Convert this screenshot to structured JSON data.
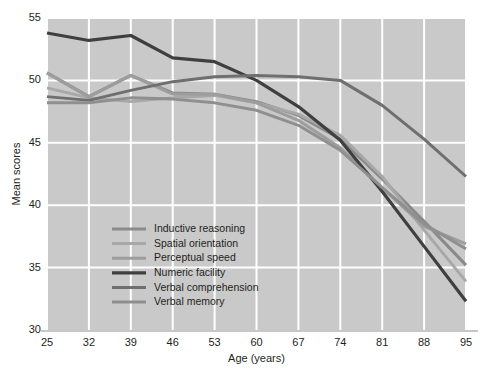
{
  "chart_data": {
    "type": "line",
    "title": "",
    "xlabel": "Age (years)",
    "ylabel": "Mean scores",
    "x": [
      25,
      32,
      39,
      46,
      53,
      60,
      67,
      74,
      81,
      88,
      95
    ],
    "categories": [
      "25",
      "32",
      "39",
      "46",
      "53",
      "60",
      "67",
      "74",
      "81",
      "88",
      "95"
    ],
    "xlim": [
      25,
      95
    ],
    "ylim": [
      30,
      55
    ],
    "xticks": [
      25,
      32,
      39,
      46,
      53,
      60,
      67,
      74,
      81,
      88,
      95
    ],
    "yticks": [
      30,
      35,
      40,
      45,
      50,
      55
    ],
    "grid": true,
    "grid_color": "#ffffff",
    "plot_background": "#c9c9c9",
    "figure_background": "#ffffff",
    "legend_position": "inside lower-left",
    "series": [
      {
        "name": "Inductive reasoning",
        "color": "#8a8a8a",
        "width": 3.0,
        "values": [
          50.6,
          48.7,
          50.4,
          49.0,
          48.9,
          48.3,
          47.2,
          45.3,
          42.1,
          38.7,
          35.2
        ]
      },
      {
        "name": "Spatial orientation",
        "color": "#a8a8a8",
        "width": 3.0,
        "values": [
          49.4,
          48.6,
          48.3,
          48.6,
          48.8,
          48.2,
          47.3,
          45.6,
          42.3,
          38.0,
          33.9
        ]
      },
      {
        "name": "Perceptual speed",
        "color": "#9d9d9d",
        "width": 3.0,
        "values": [
          50.6,
          48.7,
          50.4,
          48.9,
          48.9,
          48.2,
          46.8,
          44.6,
          41.4,
          38.3,
          36.9
        ]
      },
      {
        "name": "Numeric facility",
        "color": "#3f3f3f",
        "width": 3.2,
        "values": [
          53.8,
          53.2,
          53.6,
          51.8,
          51.5,
          50.0,
          47.9,
          45.2,
          41.1,
          36.7,
          32.3
        ]
      },
      {
        "name": "Verbal comprehension",
        "color": "#6f6f6f",
        "width": 3.0,
        "values": [
          48.7,
          48.4,
          49.2,
          49.9,
          50.3,
          50.4,
          50.3,
          50.0,
          48.0,
          45.3,
          42.3
        ]
      },
      {
        "name": "Verbal memory",
        "color": "#8f8f8f",
        "width": 3.0,
        "values": [
          48.2,
          48.2,
          48.6,
          48.5,
          48.2,
          47.6,
          46.4,
          44.4,
          41.4,
          38.5,
          36.5
        ]
      }
    ]
  },
  "legend": {
    "items": [
      {
        "label": "Inductive reasoning"
      },
      {
        "label": "Spatial orientation"
      },
      {
        "label": "Perceptual speed"
      },
      {
        "label": "Numeric facility"
      },
      {
        "label": "Verbal comprehension"
      },
      {
        "label": "Verbal memory"
      }
    ]
  }
}
